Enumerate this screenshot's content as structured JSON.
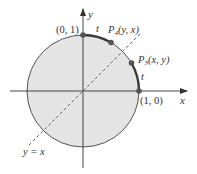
{
  "diagram": {
    "title": "",
    "colors": {
      "disk_fill": "#e4e4e4",
      "circle_stroke": "#555555",
      "arc_highlight": "#3a3a3a",
      "axis": "#444444",
      "dashed_line": "#555555",
      "point": "#555555",
      "text": "#333333"
    },
    "axes": {
      "x_label": "x",
      "y_label": "y"
    },
    "points": [
      {
        "id": "point-0-1",
        "label": "(0, 1)"
      },
      {
        "id": "point-P4",
        "name": "P",
        "subscript": "4",
        "coords": "(y, x)"
      },
      {
        "id": "point-P3",
        "name": "P",
        "subscript": "3",
        "coords": "(x, y)"
      },
      {
        "id": "point-1-0",
        "label": "(1, 0)"
      }
    ],
    "arc_labels": {
      "top": "t",
      "right": "t"
    },
    "line_label": "y = x"
  }
}
